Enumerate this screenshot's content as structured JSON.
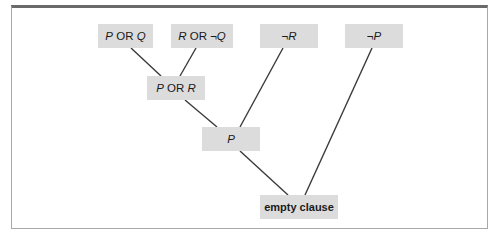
{
  "diagram": {
    "type": "resolution-refutation-tree",
    "nodes": [
      {
        "id": "n1",
        "label": "P OR Q",
        "html": "<i>P</i> OR <i>Q</i>",
        "x": 98,
        "y": 24,
        "w": 55
      },
      {
        "id": "n2",
        "label": "R OR ¬Q",
        "html": "<i>R</i> OR ¬<i>Q</i>",
        "x": 171,
        "y": 24,
        "w": 62
      },
      {
        "id": "n3",
        "label": "¬R",
        "html": "¬<i>R</i>",
        "x": 260,
        "y": 24,
        "w": 58
      },
      {
        "id": "n4",
        "label": "¬P",
        "html": "¬<i>P</i>",
        "x": 345,
        "y": 24,
        "w": 58
      },
      {
        "id": "n5",
        "label": "P OR R",
        "html": "<i>P</i> OR <i>R</i>",
        "x": 147,
        "y": 76,
        "w": 58
      },
      {
        "id": "n6",
        "label": "P",
        "html": "<i>P</i>",
        "x": 202,
        "y": 127,
        "w": 58
      },
      {
        "id": "n7",
        "label": "empty clause",
        "html": "empty clause",
        "x": 260,
        "y": 195,
        "w": 78,
        "bold": true
      }
    ],
    "edges": [
      {
        "from": "n1",
        "to": "n5",
        "x1": 131,
        "y1": 48,
        "x2": 161,
        "y2": 76
      },
      {
        "from": "n2",
        "to": "n5",
        "x1": 196,
        "y1": 48,
        "x2": 180,
        "y2": 76
      },
      {
        "from": "n5",
        "to": "n6",
        "x1": 185,
        "y1": 100,
        "x2": 217,
        "y2": 127
      },
      {
        "from": "n3",
        "to": "n6",
        "x1": 283,
        "y1": 48,
        "x2": 240,
        "y2": 127
      },
      {
        "from": "n6",
        "to": "n7",
        "x1": 240,
        "y1": 151,
        "x2": 288,
        "y2": 195
      },
      {
        "from": "n4",
        "to": "n7",
        "x1": 372,
        "y1": 48,
        "x2": 305,
        "y2": 195
      }
    ]
  },
  "colors": {
    "node_fill": "#dcdcdc",
    "edge": "#3a3a3a",
    "frame_top": "#6a6a6a",
    "frame_border": "#a8a8a8"
  }
}
